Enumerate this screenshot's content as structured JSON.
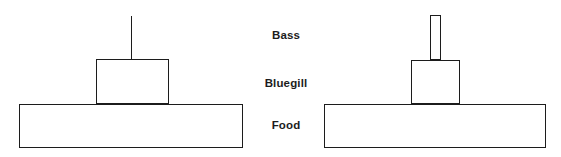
{
  "figure": {
    "type": "diagram",
    "subtype": "energy-pyramid-comparison",
    "background_color": "#ffffff",
    "line_color": "#1c1c1c",
    "text_color": "#1c1c1c",
    "width": 561,
    "height": 157
  },
  "labels": {
    "tier_top": "Bass",
    "tier_middle": "Bluegill",
    "tier_bottom": "Food",
    "column_center_x": 286,
    "tier_top_y": 36,
    "tier_middle_y": 84,
    "tier_bottom_y": 126
  },
  "pyramids": [
    {
      "id": "left-pyramid",
      "name": "left-energy-pyramid",
      "tiers": [
        {
          "id": "left-bass",
          "level": "Bass",
          "shape": "line",
          "x": 130.5,
          "y": 16,
          "width": 0,
          "height": 43
        },
        {
          "id": "left-bluegill",
          "level": "Bluegill",
          "shape": "rect",
          "x": 96,
          "y": 59,
          "width": 73,
          "height": 45
        },
        {
          "id": "left-food",
          "level": "Food",
          "shape": "rect",
          "x": 19,
          "y": 104,
          "width": 224,
          "height": 44
        }
      ]
    },
    {
      "id": "right-pyramid",
      "name": "right-energy-pyramid",
      "tiers": [
        {
          "id": "right-bass",
          "level": "Bass",
          "shape": "rect",
          "x": 430,
          "y": 15,
          "width": 11,
          "height": 45
        },
        {
          "id": "right-bluegill",
          "level": "Bluegill",
          "shape": "rect",
          "x": 411,
          "y": 60,
          "width": 49,
          "height": 44
        },
        {
          "id": "right-food",
          "level": "Food",
          "shape": "rect",
          "x": 324,
          "y": 104,
          "width": 222,
          "height": 44
        }
      ]
    }
  ]
}
